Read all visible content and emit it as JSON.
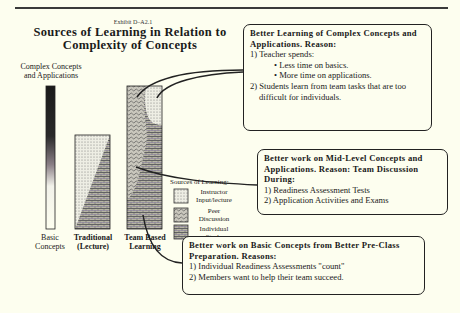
{
  "exhibit": "Exhibit D–A2.1",
  "title_line1": "Sources of Learning in Relation to",
  "title_line2": "Complexity of Concepts",
  "axis": {
    "top_label_line1": "Complex Concepts",
    "top_label_line2": "and Applications",
    "bottom_label_line1": "Basic",
    "bottom_label_line2": "Concepts"
  },
  "bars": [
    {
      "label_line1": "Traditional",
      "label_line2": "(Lecture)"
    },
    {
      "label_line1": "Team Based",
      "label_line2": "Learning"
    }
  ],
  "legend": {
    "title": "Sources of Learning:",
    "items": [
      {
        "label_line1": "Instructor",
        "label_line2": "Input/lecture",
        "pattern": "dots"
      },
      {
        "label_line1": "Peer",
        "label_line2": "Discussion",
        "pattern": "waves"
      },
      {
        "label_line1": "Individual",
        "label_line2": "Study",
        "pattern": "bricks"
      }
    ]
  },
  "boxes": {
    "complex": {
      "heading": "Better Learning of Complex Concepts and Applications. Reason:",
      "line1": "1) Teacher spends:",
      "bullet1": "• Less time on basics.",
      "bullet2": "• More time on applications.",
      "line2": "2) Students learn from team tasks that are too difficult for individuals."
    },
    "mid": {
      "heading": "Better work on Mid-Level Concepts and Applications. Reason: Team Discussion During:",
      "line1": "1) Readiness Assessment Tests",
      "line2": "2) Application Activities and Exams"
    },
    "basic": {
      "heading": "Better work on Basic Concepts from Better Pre-Class Preparation. Reasons:",
      "line1": "1) Individual Readiness Assessments \"count\"",
      "line2": "2) Members want to help their team succeed."
    }
  },
  "colors": {
    "background": "#fdfeef",
    "ink": "#1a1a1a"
  }
}
